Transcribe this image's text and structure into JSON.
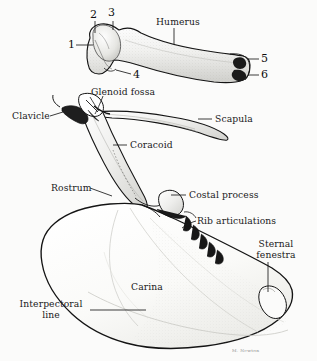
{
  "figure": {
    "background_color": "#fbfbfa",
    "ink_color": "#141414",
    "signature": "M. Newton"
  },
  "labels": {
    "humerus": "Humerus",
    "glenoid_fossa": "Glenoid fossa",
    "clavicle": "Clavicle",
    "scapula": "Scapula",
    "coracoid": "Coracoid",
    "rostrum": "Rostrum",
    "costal_process": "Costal process",
    "rib_articulations": "Rib articulations",
    "sternal_fenestra_line1": "Sternal",
    "sternal_fenestra_line2": "fenestra",
    "carina": "Carina",
    "interpectoral_line1": "Interpectoral",
    "interpectoral_line2": "line"
  },
  "callouts": {
    "n1": "1",
    "n2": "2",
    "n3": "3",
    "n4": "4",
    "n5": "5",
    "n6": "6"
  }
}
